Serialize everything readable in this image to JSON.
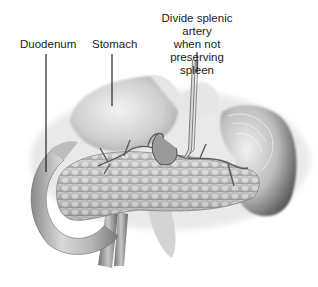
{
  "figure": {
    "style": "grayscale medical illustration",
    "labels": [
      {
        "id": "duodenum",
        "text": "Duodenum"
      },
      {
        "id": "stomach",
        "text": "Stomach"
      },
      {
        "id": "splenic_artery",
        "text": "Divide splenic artery when not preserving spleen",
        "lines": [
          "Divide splenic artery",
          "when not preserving",
          "spleen"
        ]
      }
    ],
    "structures": [
      "duodenum",
      "stomach",
      "pancreas",
      "splenic artery",
      "spleen",
      "blood vessels"
    ]
  }
}
